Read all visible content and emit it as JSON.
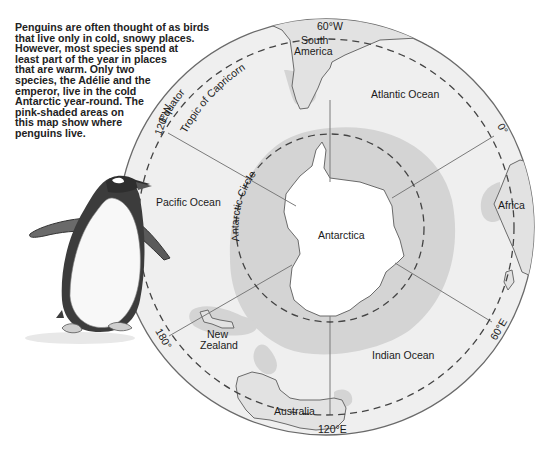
{
  "caption": {
    "lines": [
      "Penguins are often thought of as birds",
      "that live only in cold, snowy places.",
      "However, most species spend at",
      "least part of the year in places",
      "that are warm. Only two",
      "species, the Adélie and the",
      "emperor, live in the cold",
      "Antarctic year-round. The",
      "pink-shaded areas on",
      "this map show where",
      "penguins live."
    ]
  },
  "map": {
    "center_label": "Antarctica",
    "oceans": {
      "atlantic": "Atlantic Ocean",
      "pacific": "Pacific Ocean",
      "indian": "Indian Ocean"
    },
    "continents": {
      "south_america_line1": "South",
      "south_america_line2": "America",
      "africa": "Africa",
      "australia": "Australia",
      "new_zealand_line1": "New",
      "new_zealand_line2": "Zealand"
    },
    "lines": {
      "equator": "Equator",
      "tropic": "Tropic of Capricorn",
      "antarctic_circle": "Antarctic Circle"
    },
    "longitudes": {
      "w60": "60°W",
      "zero": "0°",
      "e60": "60°E",
      "e120": "120°E",
      "deg180": "180°",
      "w120": "120°W"
    },
    "colors": {
      "ocean": "#efefef",
      "penguin_range": "#d4d4d4",
      "land": "#e2e2e2",
      "antarctica": "#ffffff",
      "outline": "#6a6a6a"
    }
  }
}
